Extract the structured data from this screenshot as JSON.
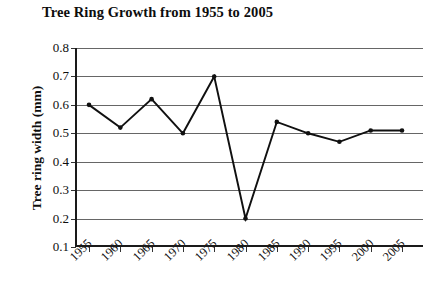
{
  "chart_data": {
    "type": "line",
    "title": "Tree Ring Growth from 1955 to 2005",
    "xlabel": "",
    "ylabel": "Tree ring width (mm)",
    "categories": [
      "1955",
      "1960",
      "1965",
      "1970",
      "1975",
      "1980",
      "1985",
      "1990",
      "1995",
      "2000",
      "2005"
    ],
    "values": [
      0.6,
      0.52,
      0.62,
      0.5,
      0.7,
      0.2,
      0.54,
      0.5,
      0.47,
      0.51,
      0.51
    ],
    "series": [
      {
        "name": "Tree ring width",
        "values": [
          0.6,
          0.52,
          0.62,
          0.5,
          0.7,
          0.2,
          0.54,
          0.5,
          0.47,
          0.51,
          0.51
        ]
      }
    ],
    "ylim": [
      0.1,
      0.8
    ],
    "ytick_labels": [
      "0.8",
      "0.7",
      "0.6",
      "0.5",
      "0.4",
      "0.3",
      "0.2",
      "0.1"
    ],
    "ytick_values": [
      0.8,
      0.7,
      0.6,
      0.5,
      0.4,
      0.3,
      0.2,
      0.1
    ],
    "grid": "horizontal",
    "legend": "none",
    "marker": "filled-circle",
    "line_color": "#101010",
    "grid_color": "#666666",
    "axis_color": "#1a1a1a",
    "background_color": "#ffffff"
  }
}
